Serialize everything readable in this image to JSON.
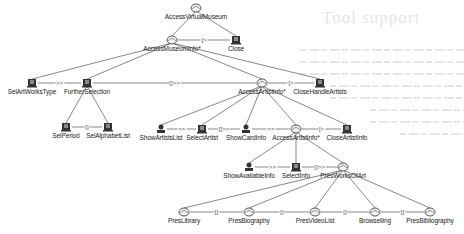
{
  "background_bleed": {
    "heading": "Tool support",
    "lines": [
      "",
      "",
      "",
      ""
    ]
  },
  "nodes": [
    {
      "id": "AccessVirtualMuseum",
      "label": "AccessVirtualMuseum",
      "type": "abstract",
      "x": 196,
      "y": 8
    },
    {
      "id": "AccessMuseumInfo",
      "label": "AccessMuseumInfo*",
      "type": "abstract",
      "x": 172,
      "y": 40
    },
    {
      "id": "Close",
      "label": "Close",
      "type": "interaction",
      "x": 236,
      "y": 40
    },
    {
      "id": "SelArtWorksType",
      "label": "SelArtWorksType",
      "type": "interaction",
      "x": 32,
      "y": 83
    },
    {
      "id": "FurtherSelection",
      "label": "FurtherSelection",
      "type": "interaction",
      "x": 87,
      "y": 83
    },
    {
      "id": "AccessArtistInfo1",
      "label": "AccessArtistInfo*",
      "type": "abstract",
      "x": 262,
      "y": 83
    },
    {
      "id": "CloseHandleArtists",
      "label": "CloseHandleArtists",
      "type": "interaction",
      "x": 320,
      "y": 83
    },
    {
      "id": "SelPeriod",
      "label": "SelPeriod",
      "type": "interaction",
      "x": 66,
      "y": 127
    },
    {
      "id": "SelAlphabetList",
      "label": "SelAlphabetList",
      "type": "interaction",
      "x": 108,
      "y": 127
    },
    {
      "id": "ShowArtistsList",
      "label": "ShowArtistsList",
      "type": "user",
      "x": 161,
      "y": 129
    },
    {
      "id": "SelectArtist",
      "label": "SelectArtist",
      "type": "interaction",
      "x": 202,
      "y": 129
    },
    {
      "id": "ShowCardInfo",
      "label": "ShowCardInfo",
      "type": "user",
      "x": 246,
      "y": 129
    },
    {
      "id": "AccessArtistInfo2",
      "label": "AccessArtistInfo*",
      "type": "abstract",
      "x": 296,
      "y": 129
    },
    {
      "id": "CloseArtistInfo",
      "label": "CloseArtistInfo",
      "type": "interaction",
      "x": 347,
      "y": 129
    },
    {
      "id": "ShowAvailableInfo",
      "label": "ShowAvailableInfo",
      "type": "user",
      "x": 249,
      "y": 167
    },
    {
      "id": "SelectInfo",
      "label": "SelectInfo",
      "type": "interaction",
      "x": 296,
      "y": 167
    },
    {
      "id": "PresWorksOfArt",
      "label": "PresWorksOfArt",
      "type": "abstract",
      "x": 343,
      "y": 167
    },
    {
      "id": "PresLibrary",
      "label": "PresLibrary",
      "type": "abstract",
      "x": 184,
      "y": 212
    },
    {
      "id": "PresBiography",
      "label": "PresBiography",
      "type": "abstract",
      "x": 249,
      "y": 212
    },
    {
      "id": "PresVideoList",
      "label": "PresVideoList",
      "type": "abstract",
      "x": 315,
      "y": 212
    },
    {
      "id": "Browselling",
      "label": "Browselling",
      "type": "abstract",
      "x": 375,
      "y": 212
    },
    {
      "id": "PresBibliography",
      "label": "PresBibliography",
      "type": "abstract",
      "x": 430,
      "y": 212
    }
  ],
  "edges": [
    [
      "AccessVirtualMuseum",
      "AccessMuseumInfo"
    ],
    [
      "AccessVirtualMuseum",
      "Close"
    ],
    [
      "AccessMuseumInfo",
      "SelArtWorksType"
    ],
    [
      "AccessMuseumInfo",
      "FurtherSelection"
    ],
    [
      "AccessMuseumInfo",
      "AccessArtistInfo1"
    ],
    [
      "AccessMuseumInfo",
      "CloseHandleArtists"
    ],
    [
      "FurtherSelection",
      "SelPeriod"
    ],
    [
      "FurtherSelection",
      "SelAlphabetList"
    ],
    [
      "AccessArtistInfo1",
      "ShowArtistsList"
    ],
    [
      "AccessArtistInfo1",
      "SelectArtist"
    ],
    [
      "AccessArtistInfo1",
      "ShowCardInfo"
    ],
    [
      "AccessArtistInfo1",
      "AccessArtistInfo2"
    ],
    [
      "AccessArtistInfo1",
      "CloseArtistInfo"
    ],
    [
      "AccessArtistInfo2",
      "ShowAvailableInfo"
    ],
    [
      "AccessArtistInfo2",
      "SelectInfo"
    ],
    [
      "AccessArtistInfo2",
      "PresWorksOfArt"
    ],
    [
      "PresWorksOfArt",
      "PresLibrary"
    ],
    [
      "PresWorksOfArt",
      "PresBiography"
    ],
    [
      "PresWorksOfArt",
      "PresVideoList"
    ],
    [
      "PresWorksOfArt",
      "Browselling"
    ],
    [
      "PresWorksOfArt",
      "PresBibliography"
    ]
  ],
  "operators": [
    {
      "from": "AccessMuseumInfo",
      "to": "Close",
      "symbol": "[>"
    },
    {
      "from": "SelArtWorksType",
      "to": "FurtherSelection",
      "symbol": ">>"
    },
    {
      "from": "FurtherSelection",
      "to": "AccessArtistInfo1",
      "symbol": "[]>>"
    },
    {
      "from": "AccessArtistInfo1",
      "to": "CloseHandleArtists",
      "symbol": "[>"
    },
    {
      "from": "SelPeriod",
      "to": "SelAlphabetList",
      "symbol": "[]"
    },
    {
      "from": "ShowArtistsList",
      "to": "SelectArtist",
      "symbol": ">>"
    },
    {
      "from": "SelectArtist",
      "to": "ShowCardInfo",
      "symbol": "[]>>"
    },
    {
      "from": "ShowCardInfo",
      "to": "AccessArtistInfo2",
      "symbol": ">>"
    },
    {
      "from": "AccessArtistInfo2",
      "to": "CloseArtistInfo",
      "symbol": "[>"
    },
    {
      "from": "ShowAvailableInfo",
      "to": "SelectInfo",
      "symbol": ">>"
    },
    {
      "from": "SelectInfo",
      "to": "PresWorksOfArt",
      "symbol": "[]>>"
    },
    {
      "from": "PresLibrary",
      "to": "PresBiography",
      "symbol": "[]"
    },
    {
      "from": "PresBiography",
      "to": "PresVideoList",
      "symbol": "[]"
    },
    {
      "from": "PresVideoList",
      "to": "Browselling",
      "symbol": "[]"
    },
    {
      "from": "Browselling",
      "to": "PresBibliography",
      "symbol": "[]"
    }
  ],
  "colors": {
    "line": "#555555",
    "icon_dark": "#333333",
    "icon_light": "#f2f2f2",
    "text": "#222222",
    "bleed": "#e6e6e6"
  }
}
